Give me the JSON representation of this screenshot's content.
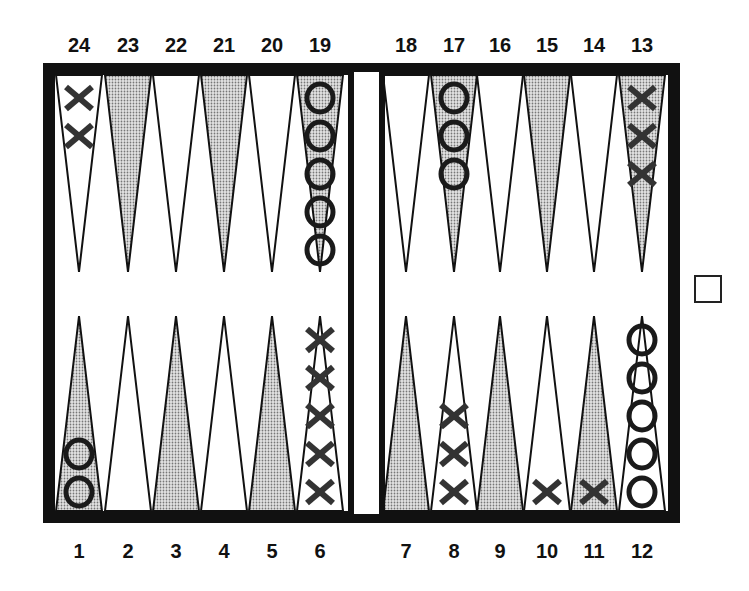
{
  "diagram": {
    "type": "backgammon-position",
    "colors": {
      "border": "#111111",
      "shaded_point": "#c8c8c8",
      "light_point": "#ffffff",
      "checker_ink": "#1a1a1a"
    },
    "top_labels": [
      "24",
      "23",
      "22",
      "21",
      "20",
      "19",
      "18",
      "17",
      "16",
      "15",
      "14",
      "13"
    ],
    "bottom_labels": [
      "1",
      "2",
      "3",
      "4",
      "5",
      "6",
      "7",
      "8",
      "9",
      "10",
      "11",
      "12"
    ],
    "points": [
      {
        "point": 1,
        "player": "O",
        "count": 2
      },
      {
        "point": 6,
        "player": "X",
        "count": 5
      },
      {
        "point": 8,
        "player": "X",
        "count": 3
      },
      {
        "point": 10,
        "player": "X",
        "count": 1
      },
      {
        "point": 11,
        "player": "X",
        "count": 1
      },
      {
        "point": 12,
        "player": "O",
        "count": 5
      },
      {
        "point": 13,
        "player": "X",
        "count": 3
      },
      {
        "point": 17,
        "player": "O",
        "count": 3
      },
      {
        "point": 19,
        "player": "O",
        "count": 5
      },
      {
        "point": 24,
        "player": "X",
        "count": 2
      }
    ],
    "cube": {
      "value": "",
      "position": "center-right"
    }
  }
}
